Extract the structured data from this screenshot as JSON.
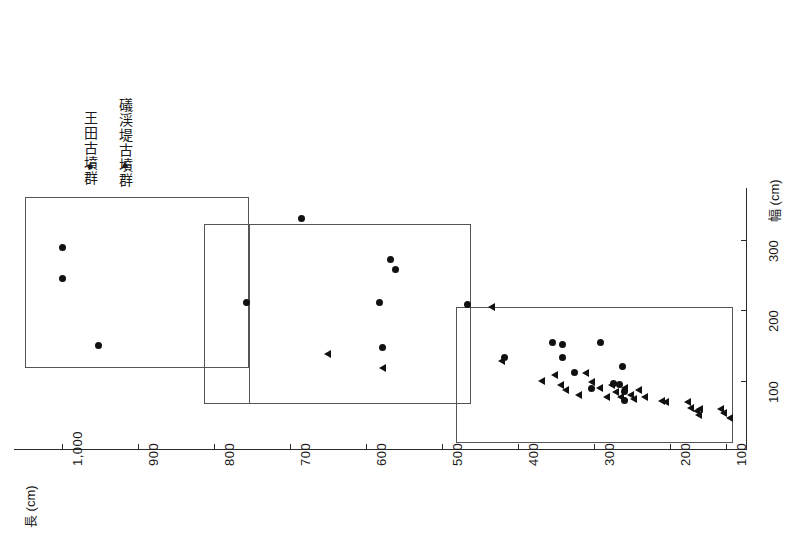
{
  "figure": {
    "orientation": "rotated-90",
    "x_axis_title": "長 (cm)",
    "y_axis_title": "幅 (cm)"
  },
  "legend": {
    "items": [
      {
        "glyph": "●",
        "marker": "circle",
        "label": "王田古墳群"
      },
      {
        "glyph": "▲",
        "marker": "triangle",
        "label": "礒渓堤古墳群"
      }
    ]
  },
  "chart_data": {
    "type": "scatter",
    "title": "",
    "xlabel": "長 (cm)",
    "ylabel": "幅 (cm)",
    "xlim": [
      1050,
      40
    ],
    "ylim": [
      0,
      360
    ],
    "x_ticks": [
      "1,000",
      "900",
      "800",
      "700",
      "600",
      "500",
      "400",
      "300",
      "200",
      "100"
    ],
    "x_tick_values": [
      1000,
      900,
      800,
      700,
      600,
      500,
      400,
      300,
      200,
      100
    ],
    "y_ticks": [
      "300",
      "200",
      "100"
    ],
    "y_tick_values": [
      300,
      200,
      100
    ],
    "grid": false,
    "legend_position": "top-left",
    "series": [
      {
        "name": "王田古墳群",
        "marker": "circle",
        "points": [
          [
            1000,
            290
          ],
          [
            1000,
            245
          ],
          [
            950,
            150
          ],
          [
            750,
            212
          ],
          [
            675,
            330
          ],
          [
            555,
            272
          ],
          [
            548,
            258
          ],
          [
            570,
            212
          ],
          [
            565,
            148
          ],
          [
            450,
            208
          ],
          [
            400,
            133
          ],
          [
            335,
            155
          ],
          [
            322,
            152
          ],
          [
            322,
            133
          ],
          [
            305,
            112
          ],
          [
            282,
            90
          ],
          [
            270,
            155
          ],
          [
            252,
            96
          ],
          [
            245,
            95
          ],
          [
            240,
            120
          ],
          [
            238,
            85
          ],
          [
            237,
            72
          ]
        ]
      },
      {
        "name": "礒渓堤古墳群",
        "marker": "triangle",
        "points": [
          [
            640,
            138
          ],
          [
            565,
            118
          ],
          [
            418,
            205
          ],
          [
            405,
            128
          ],
          [
            350,
            100
          ],
          [
            332,
            108
          ],
          [
            325,
            95
          ],
          [
            318,
            88
          ],
          [
            300,
            80
          ],
          [
            290,
            112
          ],
          [
            282,
            98
          ],
          [
            272,
            90
          ],
          [
            262,
            78
          ],
          [
            255,
            95
          ],
          [
            250,
            85
          ],
          [
            243,
            78
          ],
          [
            238,
            90
          ],
          [
            230,
            80
          ],
          [
            225,
            75
          ],
          [
            218,
            88
          ],
          [
            210,
            78
          ],
          [
            188,
            72
          ],
          [
            182,
            70
          ],
          [
            152,
            70
          ],
          [
            148,
            62
          ],
          [
            140,
            58
          ],
          [
            138,
            52
          ],
          [
            136,
            60
          ],
          [
            108,
            60
          ],
          [
            104,
            55
          ],
          [
            96,
            48
          ]
        ]
      }
    ],
    "groups": [
      {
        "name": "group-1",
        "x_range": [
          1035,
          742
        ],
        "y_range": [
          110,
          340
        ]
      },
      {
        "name": "group-2",
        "x_range": [
          800,
          742
        ],
        "y_range": [
          90,
          345
        ]
      },
      {
        "name": "group-3",
        "x_range": [
          800,
          440
        ],
        "y_range": [
          85,
          320
        ]
      },
      {
        "name": "group-4",
        "x_range": [
          460,
          70
        ],
        "y_range": [
          40,
          215
        ]
      }
    ]
  }
}
